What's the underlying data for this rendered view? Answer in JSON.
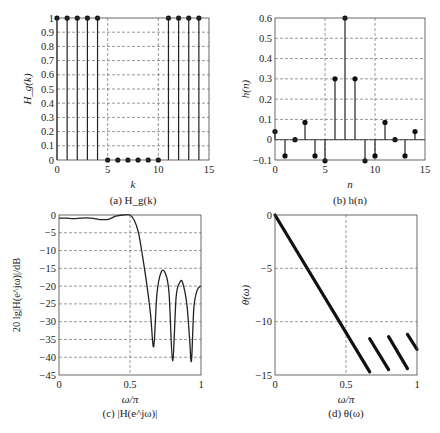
{
  "chart_data": [
    {
      "id": "a",
      "type": "stem",
      "title": "",
      "caption": "(a) H_g(k)",
      "caption_parts": {
        "prefix": "(a) ",
        "sym": "H",
        "sub": "g",
        "arg": "(k)"
      },
      "xlabel": "k",
      "ylabel": "H_g(k)",
      "xlim": [
        0,
        15
      ],
      "ylim": [
        0,
        1
      ],
      "xticks": [
        0,
        5,
        10,
        15
      ],
      "yticks": [
        0,
        0.1,
        0.2,
        0.3,
        0.4,
        0.5,
        0.6,
        0.7,
        0.8,
        0.9,
        1
      ],
      "ytick_labels": [
        "0",
        "0.1",
        "0.2",
        "0.3",
        "0.4",
        "0.5",
        "0.6",
        "0.7",
        "0.8",
        "0.9",
        "1"
      ],
      "grid": true,
      "x": [
        0,
        1,
        2,
        3,
        4,
        5,
        6,
        7,
        8,
        9,
        10,
        11,
        12,
        13,
        14
      ],
      "values": [
        1,
        1,
        1,
        1,
        1,
        0,
        0,
        0,
        0,
        0,
        0,
        1,
        1,
        1,
        1
      ]
    },
    {
      "id": "b",
      "type": "stem",
      "caption": "(b) h(n)",
      "xlabel": "n",
      "ylabel": "h(n)",
      "xlim": [
        0,
        15
      ],
      "ylim": [
        -0.1,
        0.6
      ],
      "xticks": [
        0,
        5,
        10,
        15
      ],
      "yticks": [
        -0.1,
        0,
        0.1,
        0.2,
        0.3,
        0.4,
        0.5,
        0.6
      ],
      "ytick_labels": [
        "−0.1",
        "0",
        "0.1",
        "0.2",
        "0.3",
        "0.4",
        "0.5",
        "0.6"
      ],
      "grid": true,
      "x": [
        0,
        1,
        2,
        3,
        4,
        5,
        6,
        7,
        8,
        9,
        10,
        11,
        12,
        13,
        14
      ],
      "values": [
        0.04,
        -0.08,
        0,
        0.085,
        -0.08,
        -0.104,
        0.3,
        0.6,
        0.3,
        -0.104,
        -0.08,
        0.085,
        0,
        -0.08,
        0.04
      ]
    },
    {
      "id": "c",
      "type": "line",
      "caption": "(c) |H(e^jω)|",
      "xlabel": "ω/π",
      "ylabel": "20 lg|H(e^jω)|/dB",
      "xlim": [
        0,
        1
      ],
      "ylim": [
        -45,
        0
      ],
      "xticks": [
        0,
        0.5,
        1
      ],
      "xtick_labels": [
        "0",
        "0.5",
        "1"
      ],
      "yticks": [
        0,
        -5,
        -10,
        -15,
        -20,
        -25,
        -30,
        -35,
        -40,
        -45
      ],
      "ytick_labels": [
        "0",
        "−5",
        "−10",
        "−15",
        "−20",
        "−25",
        "−30",
        "−35",
        "−40",
        "−45"
      ],
      "grid": true,
      "x": [
        0,
        0.05,
        0.1,
        0.15,
        0.2,
        0.25,
        0.3,
        0.35,
        0.4,
        0.45,
        0.5,
        0.53,
        0.56,
        0.59,
        0.62,
        0.645,
        0.667,
        0.69,
        0.72,
        0.75,
        0.775,
        0.8,
        0.825,
        0.85,
        0.87,
        0.9,
        0.92,
        0.933,
        0.95,
        0.975,
        1
      ],
      "values": [
        -0.9,
        -0.9,
        -1.0,
        -0.9,
        -0.8,
        -1.0,
        -1.3,
        -1.2,
        -0.3,
        0,
        0,
        -1.5,
        -5,
        -12,
        -20,
        -28,
        -37,
        -22,
        -16,
        -16.5,
        -22,
        -41,
        -23,
        -19,
        -19,
        -25,
        -35,
        -41,
        -26,
        -21,
        -20
      ]
    },
    {
      "id": "d",
      "type": "line",
      "caption": "(d) θ(ω)",
      "xlabel": "ω/π",
      "ylabel": "θ(ω)",
      "xlim": [
        0,
        1
      ],
      "ylim": [
        -15,
        0
      ],
      "xticks": [
        0,
        0.5,
        1
      ],
      "xtick_labels": [
        "0",
        "0.5",
        "1"
      ],
      "yticks": [
        0,
        -5,
        -10,
        -15
      ],
      "ytick_labels": [
        "0",
        "−5",
        "−10",
        "−15"
      ],
      "grid": true,
      "segments": [
        {
          "x": [
            0,
            0.667
          ],
          "values": [
            0,
            -14.7
          ]
        },
        {
          "x": [
            0.667,
            0.8
          ],
          "values": [
            -11.6,
            -14.5
          ]
        },
        {
          "x": [
            0.8,
            0.933
          ],
          "values": [
            -11.4,
            -14.4
          ]
        },
        {
          "x": [
            0.933,
            1
          ],
          "values": [
            -11.2,
            -12.6
          ]
        }
      ]
    }
  ]
}
